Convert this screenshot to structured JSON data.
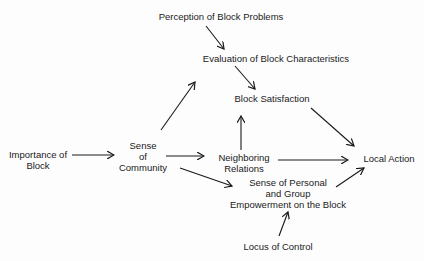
{
  "diagram": {
    "type": "path-model",
    "nodes": [
      {
        "id": "perception",
        "lines": [
          "Perception of Block Problems"
        ]
      },
      {
        "id": "evaluation",
        "lines": [
          "Evaluation of Block Characteristics"
        ]
      },
      {
        "id": "satisfaction",
        "lines": [
          "Block Satisfaction"
        ]
      },
      {
        "id": "importance",
        "lines": [
          "Importance of",
          "Block"
        ]
      },
      {
        "id": "community",
        "lines": [
          "Sense",
          "of",
          "Community"
        ]
      },
      {
        "id": "neighboring",
        "lines": [
          "Neighboring",
          "Relations"
        ]
      },
      {
        "id": "local_action",
        "lines": [
          "Local Action"
        ]
      },
      {
        "id": "empowerment",
        "lines": [
          "Sense of Personal",
          "and Group",
          "Empowerment on the Block"
        ]
      },
      {
        "id": "locus",
        "lines": [
          "Locus of Control"
        ]
      }
    ],
    "edges": [
      {
        "from": "perception",
        "to": "evaluation"
      },
      {
        "from": "evaluation",
        "to": "satisfaction"
      },
      {
        "from": "community",
        "to": "evaluation"
      },
      {
        "from": "neighboring",
        "to": "satisfaction"
      },
      {
        "from": "satisfaction",
        "to": "local_action"
      },
      {
        "from": "importance",
        "to": "community"
      },
      {
        "from": "community",
        "to": "neighboring"
      },
      {
        "from": "neighboring",
        "to": "local_action"
      },
      {
        "from": "community",
        "to": "empowerment"
      },
      {
        "from": "empowerment",
        "to": "local_action"
      },
      {
        "from": "locus",
        "to": "empowerment"
      }
    ]
  }
}
